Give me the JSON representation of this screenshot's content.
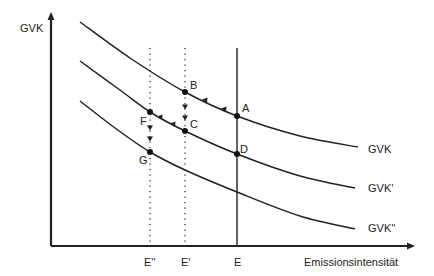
{
  "diagram": {
    "y_axis_label": "GVK",
    "x_axis_label": "Emissionsintensität",
    "curves": [
      {
        "name": "GVK",
        "points": [
          [
            80,
            22
          ],
          [
            130,
            58
          ],
          [
            185,
            92
          ],
          [
            237,
            116
          ],
          [
            300,
            136
          ],
          [
            358,
            147
          ]
        ]
      },
      {
        "name": "GVK'",
        "points": [
          [
            80,
            61
          ],
          [
            120,
            90
          ],
          [
            150,
            112
          ],
          [
            185,
            131
          ],
          [
            237,
            154
          ],
          [
            300,
            176
          ],
          [
            355,
            188
          ]
        ]
      },
      {
        "name": "GVK''",
        "points": [
          [
            80,
            101
          ],
          [
            115,
            128
          ],
          [
            150,
            152
          ],
          [
            185,
            170
          ],
          [
            237,
            192
          ],
          [
            300,
            216
          ],
          [
            355,
            229
          ]
        ]
      }
    ],
    "x_ticks": [
      {
        "label": "E''",
        "x": 150,
        "style": "dotted"
      },
      {
        "label": "E'",
        "x": 185,
        "style": "dotted"
      },
      {
        "label": "E",
        "x": 237,
        "style": "solid"
      }
    ],
    "points": [
      {
        "label": "A",
        "x": 237,
        "y": 116
      },
      {
        "label": "B",
        "x": 185,
        "y": 92
      },
      {
        "label": "C",
        "x": 185,
        "y": 131
      },
      {
        "label": "D",
        "x": 237,
        "y": 154
      },
      {
        "label": "F",
        "x": 150,
        "y": 112
      },
      {
        "label": "G",
        "x": 150,
        "y": 152
      }
    ],
    "arrows_along_curve": [
      {
        "x": 224,
        "y": 110,
        "dir": "left"
      },
      {
        "x": 205,
        "y": 101,
        "dir": "left"
      },
      {
        "x": 173,
        "y": 125,
        "dir": "left"
      },
      {
        "x": 160,
        "y": 118,
        "dir": "left"
      }
    ],
    "arrows_down": [
      {
        "x": 185,
        "y": 107
      },
      {
        "x": 185,
        "y": 118
      },
      {
        "x": 150,
        "y": 128
      },
      {
        "x": 150,
        "y": 139
      }
    ]
  }
}
